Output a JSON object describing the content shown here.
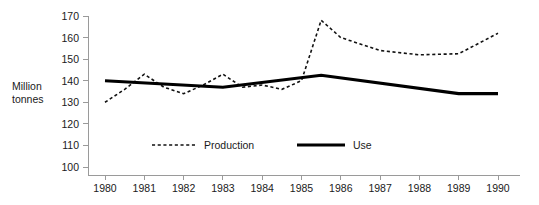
{
  "chart_data": {
    "type": "line",
    "title": "",
    "xlabel": "",
    "ylabel": "Million tonnes",
    "ylabel_line1": "Million",
    "ylabel_line2": "tonnes",
    "grid": false,
    "legend_position": "inside-bottom-center",
    "x": [
      1980,
      1981,
      1982,
      1983,
      1984,
      1985,
      1986,
      1987,
      1988,
      1989,
      1990
    ],
    "xlim": [
      1980,
      1990
    ],
    "ylim": [
      100,
      170
    ],
    "yticks": [
      100,
      110,
      120,
      130,
      140,
      150,
      160,
      170
    ],
    "ytick_labels": [
      "100",
      "110",
      "120",
      "130",
      "140",
      "150",
      "160",
      "170"
    ],
    "xtick_labels": [
      "1980",
      "1981",
      "1982",
      "1983",
      "1984",
      "1985",
      "1986",
      "1987",
      "1988",
      "1989",
      "1990"
    ],
    "series": [
      {
        "name": "Production",
        "style": "dashed",
        "color": "#111111",
        "x": [
          1980,
          1980.5,
          1981,
          1981.5,
          1982,
          1982.5,
          1983,
          1983.5,
          1984,
          1984.5,
          1985,
          1985.5,
          1986,
          1987,
          1988,
          1989,
          1990
        ],
        "values": [
          130,
          136,
          143,
          137,
          134,
          138,
          143,
          137,
          138,
          136,
          140,
          168,
          160,
          154,
          152,
          152.5,
          162
        ]
      },
      {
        "name": "Use",
        "style": "solid",
        "color": "#000000",
        "x": [
          1980,
          1983,
          1985.5,
          1989,
          1990
        ],
        "values": [
          140,
          137,
          142.5,
          134,
          134
        ]
      }
    ]
  },
  "legend": {
    "items": [
      {
        "label": "Production",
        "style": "dashed"
      },
      {
        "label": "Use",
        "style": "solid"
      }
    ]
  }
}
